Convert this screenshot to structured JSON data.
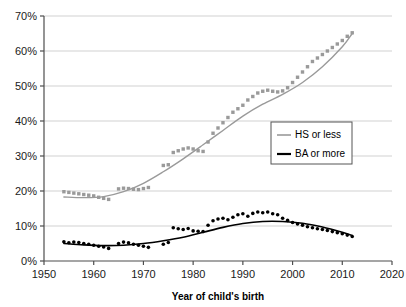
{
  "chart_data": {
    "type": "scatter",
    "title": "",
    "subtitle": "",
    "xlabel": "Year of child's birth",
    "ylabel": "",
    "xlim": [
      1950,
      2020
    ],
    "ylim": [
      0,
      70
    ],
    "xticks": [
      "1950",
      "1960",
      "1970",
      "1980",
      "1990",
      "2000",
      "2010",
      "2020"
    ],
    "xtick_values": [
      1950,
      1960,
      1970,
      1980,
      1990,
      2000,
      2010,
      2020
    ],
    "yticks": [
      "0%",
      "10%",
      "20%",
      "30%",
      "40%",
      "50%",
      "60%",
      "70%"
    ],
    "ytick_values": [
      0,
      10,
      20,
      30,
      40,
      50,
      60,
      70
    ],
    "grid": true,
    "grid_axis": "y",
    "legend_position": "center-right",
    "series": [
      {
        "name": "HS or less",
        "color": "#9a9a9a",
        "marker": "square",
        "trend_line": true,
        "x": [
          1954,
          1955,
          1956,
          1957,
          1958,
          1959,
          1960,
          1961,
          1962,
          1963,
          1965,
          1966,
          1967,
          1968,
          1969,
          1970,
          1971,
          1974,
          1975,
          1976,
          1977,
          1978,
          1979,
          1980,
          1981,
          1982,
          1983,
          1984,
          1985,
          1986,
          1987,
          1988,
          1989,
          1990,
          1991,
          1992,
          1993,
          1994,
          1995,
          1996,
          1997,
          1998,
          1999,
          2000,
          2001,
          2002,
          2003,
          2004,
          2005,
          2006,
          2007,
          2008,
          2009,
          2010,
          2011,
          2012
        ],
        "values": [
          19.8,
          19.6,
          19.4,
          19.2,
          19.0,
          18.8,
          18.6,
          18.2,
          17.9,
          17.6,
          20.6,
          20.8,
          20.7,
          20.5,
          20.4,
          20.7,
          21.0,
          27.3,
          27.5,
          31.0,
          31.5,
          32.0,
          32.3,
          32.0,
          31.5,
          31.3,
          34.0,
          36.5,
          38.0,
          39.5,
          41.0,
          42.5,
          43.5,
          44.5,
          46.0,
          47.0,
          48.0,
          48.5,
          48.8,
          48.5,
          48.3,
          48.6,
          49.5,
          51.0,
          52.5,
          54.0,
          55.5,
          57.0,
          58.0,
          59.0,
          60.0,
          61.0,
          62.0,
          63.0,
          64.2,
          65.2
        ]
      },
      {
        "name": "BA or more",
        "color": "#000000",
        "marker": "circle",
        "trend_line": true,
        "x": [
          1954,
          1955,
          1956,
          1957,
          1958,
          1959,
          1960,
          1961,
          1962,
          1963,
          1965,
          1966,
          1967,
          1968,
          1969,
          1970,
          1971,
          1974,
          1975,
          1976,
          1977,
          1978,
          1979,
          1980,
          1981,
          1982,
          1983,
          1984,
          1985,
          1986,
          1987,
          1988,
          1989,
          1990,
          1991,
          1992,
          1993,
          1994,
          1995,
          1996,
          1997,
          1998,
          1999,
          2000,
          2001,
          2002,
          2003,
          2004,
          2005,
          2006,
          2007,
          2008,
          2009,
          2010,
          2011,
          2012
        ],
        "values": [
          5.5,
          5.2,
          5.4,
          5.3,
          5.0,
          4.8,
          4.5,
          4.2,
          4.0,
          3.6,
          5.0,
          5.4,
          5.2,
          4.8,
          4.5,
          4.2,
          3.9,
          4.8,
          5.3,
          9.5,
          9.2,
          9.0,
          9.3,
          8.6,
          8.5,
          8.4,
          10.2,
          11.5,
          12.0,
          12.2,
          11.8,
          12.5,
          13.2,
          13.5,
          12.8,
          13.6,
          14.0,
          13.8,
          14.0,
          13.5,
          13.2,
          12.2,
          11.6,
          11.0,
          10.6,
          10.2,
          9.8,
          9.5,
          9.2,
          9.0,
          8.7,
          8.4,
          8.1,
          7.8,
          7.4,
          7.0
        ]
      }
    ],
    "trend_lines": [
      {
        "series": "HS or less",
        "color": "#9a9a9a",
        "points_x": [
          1954,
          1958,
          1962,
          1966,
          1970,
          1974,
          1978,
          1982,
          1986,
          1990,
          1994,
          1998,
          2002,
          2006,
          2010,
          2012
        ],
        "points_y": [
          18.3,
          18.1,
          18.4,
          19.8,
          22.2,
          25.5,
          29.2,
          33.2,
          37.3,
          41.4,
          44.8,
          47.6,
          51.0,
          55.5,
          61.2,
          65.0
        ]
      },
      {
        "series": "BA or more",
        "color": "#000000",
        "points_x": [
          1954,
          1958,
          1962,
          1966,
          1970,
          1974,
          1978,
          1982,
          1986,
          1990,
          1994,
          1998,
          2002,
          2006,
          2010,
          2012
        ],
        "points_y": [
          5.0,
          4.6,
          4.4,
          4.5,
          5.0,
          5.8,
          6.8,
          8.2,
          9.6,
          10.7,
          11.3,
          11.3,
          10.8,
          9.7,
          8.2,
          7.3
        ]
      }
    ]
  },
  "legend": {
    "items": [
      {
        "label": "HS or less",
        "color": "#9a9a9a"
      },
      {
        "label": "BA or more",
        "color": "#000000"
      }
    ]
  },
  "axes": {
    "x_title": "Year of child's birth"
  },
  "colors": {
    "hs_or_less": "#9a9a9a",
    "ba_or_more": "#000000",
    "grid": "#cccccc",
    "axis": "#4d4d4d",
    "background": "#ffffff"
  }
}
